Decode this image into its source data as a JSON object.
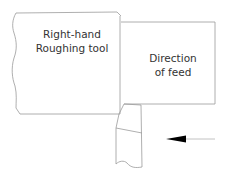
{
  "diagram": {
    "workpiece_label": {
      "line1": "Right-hand",
      "line2": "Roughing tool"
    },
    "feed_label": {
      "line1": "Direction",
      "line2": "of feed"
    },
    "arrow": {
      "direction": "left"
    },
    "colors": {
      "stroke": "#9a9a9a",
      "arrow": "#000000",
      "text": "#333333",
      "background": "#ffffff"
    }
  }
}
